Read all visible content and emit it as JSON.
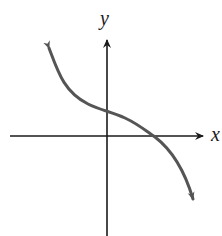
{
  "diagram": {
    "type": "function-graph",
    "axes": {
      "x_label": "x",
      "y_label": "y"
    },
    "curve": {
      "shape": "decreasing, concave up on left, concave down on right (inflection near y-intercept)",
      "y_intercept": "positive",
      "x_intercept": "positive",
      "end_behavior": {
        "left": "up",
        "right": "down"
      }
    },
    "colors": {
      "axes": "#1a1a1a",
      "curve": "#555555",
      "background": "#ffffff"
    }
  }
}
